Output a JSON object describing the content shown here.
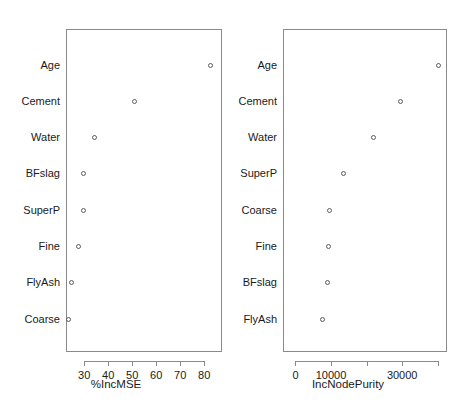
{
  "figure": {
    "width": 464,
    "height": 414,
    "background": "#ffffff",
    "point_color": "#5c5c5c",
    "axis_color": "#8a8a8a",
    "text_color": "#1a1a1a"
  },
  "chart_data": [
    {
      "type": "scatter",
      "panel": "left",
      "title": "",
      "xlabel": "%IncMSE",
      "ylabel": "",
      "categories": [
        "Age",
        "Cement",
        "Water",
        "BFslag",
        "SuperP",
        "Fine",
        "FlyAsh",
        "Coarse"
      ],
      "values": [
        82.6,
        50.7,
        34.2,
        29.6,
        29.3,
        27.5,
        24.4,
        23.4
      ],
      "xticks": [
        30,
        40,
        50,
        60,
        70,
        80
      ],
      "xticklabels": [
        "30",
        "40",
        "50",
        "60",
        "70",
        "80"
      ],
      "xlim": [
        22.4,
        87.4
      ],
      "grid": false,
      "legend": false,
      "marker": "open-circle"
    },
    {
      "type": "scatter",
      "panel": "right",
      "title": "",
      "xlabel": "IncNodePurity",
      "ylabel": "",
      "categories": [
        "Age",
        "Cement",
        "Water",
        "SuperP",
        "Coarse",
        "Fine",
        "BFslag",
        "FlyAsh"
      ],
      "values": [
        40100,
        29500,
        21900,
        13450,
        9400,
        9050,
        8750,
        7430
      ],
      "xticks": [
        0,
        10000,
        20000,
        30000,
        40000
      ],
      "xticklabels": [
        "0",
        "10000",
        "",
        "30000",
        ""
      ],
      "xlim": [
        -3500,
        42600
      ],
      "grid": false,
      "legend": false,
      "marker": "open-circle"
    }
  ]
}
